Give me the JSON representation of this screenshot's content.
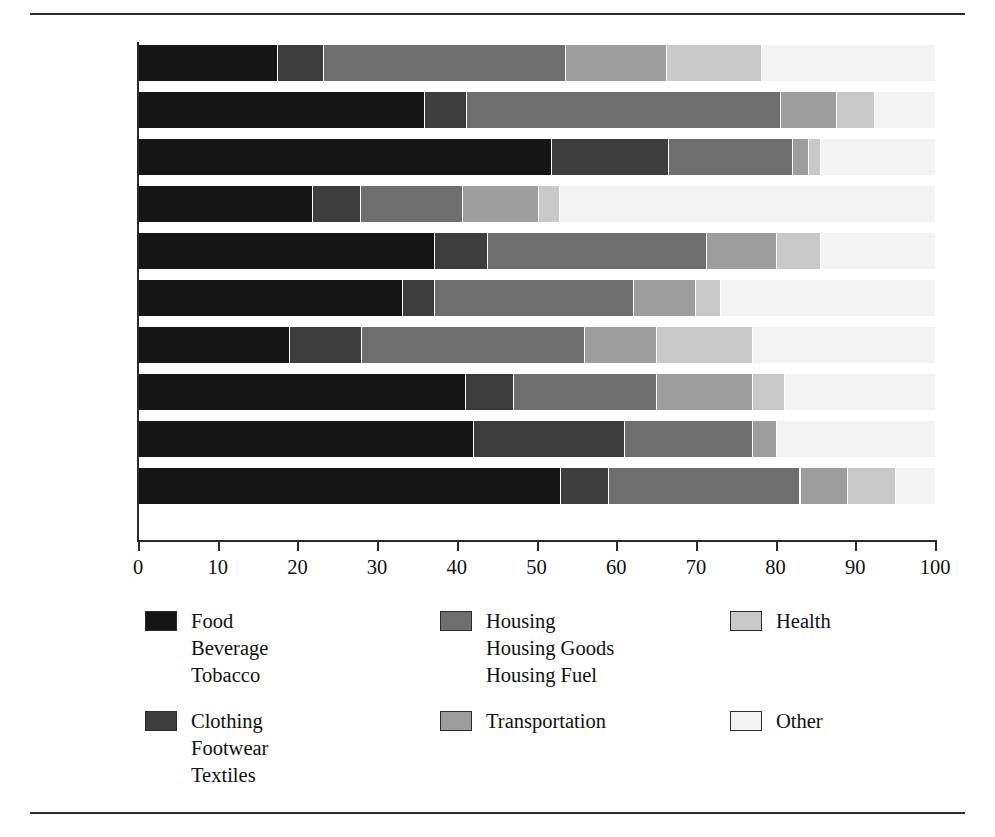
{
  "figure": {
    "title": "",
    "has_top_rule": true,
    "has_bottom_rule": true
  },
  "chart_data": {
    "type": "bar",
    "orientation": "horizontal",
    "stacked": true,
    "normalized_percent": true,
    "title": "",
    "xlabel": "",
    "ylabel": "",
    "xlim": [
      0,
      100
    ],
    "grid": false,
    "legend_position": "bottom",
    "xticks": [
      0,
      10,
      20,
      30,
      40,
      50,
      60,
      70,
      80,
      90,
      100
    ],
    "xticklabels": [
      "0",
      "10",
      "20",
      "30",
      "40",
      "50",
      "60",
      "70",
      "80",
      "90",
      "100"
    ],
    "categories": [
      "U.S.",
      "Argentina",
      "China",
      "Japan",
      "Taiwan",
      "S. Africa",
      "France",
      "Ireland",
      "U.S.S.R.",
      "Turkey"
    ],
    "series": [
      {
        "name": "Food\nBeverage\nTobacco",
        "short_name": "Food Beverage Tobacco",
        "color": "#151515",
        "values": [
          17.5,
          35.9,
          51.8,
          21.8,
          37.1,
          33.1,
          19.0,
          41.0,
          42.0,
          53.0
        ]
      },
      {
        "name": "Clothing\nFootwear\nTextiles",
        "short_name": "Clothing Footwear Textiles",
        "color": "#3d3d3d",
        "values": [
          5.7,
          5.3,
          14.7,
          6.1,
          6.7,
          4.0,
          9.0,
          6.0,
          19.0,
          6.0
        ]
      },
      {
        "name": "Housing\nHousing Goods\nHousing Fuel",
        "short_name": "Housing Housing Goods Housing Fuel",
        "color": "#6e6e6e",
        "values": [
          30.4,
          39.4,
          15.6,
          12.7,
          27.5,
          25.0,
          28.0,
          18.0,
          16.0,
          24.0
        ]
      },
      {
        "name": "Transportation",
        "short_name": "Transportation",
        "color": "#9d9d9d",
        "values": [
          12.6,
          7.0,
          2.0,
          9.6,
          8.8,
          7.8,
          9.0,
          12.0,
          3.0,
          6.0
        ]
      },
      {
        "name": "Health",
        "short_name": "Health",
        "color": "#c8c8c8",
        "values": [
          12.0,
          4.7,
          1.5,
          2.6,
          5.5,
          3.1,
          12.0,
          4.0,
          0.0,
          6.0
        ]
      },
      {
        "name": "Other",
        "short_name": "Other",
        "color": "#f3f3f3",
        "values": [
          21.8,
          7.7,
          14.4,
          47.2,
          14.4,
          27.0,
          23.0,
          19.0,
          20.0,
          5.0
        ]
      }
    ],
    "stack_boundaries": {
      "U.S.": [
        17.5,
        23.2,
        53.6,
        66.2,
        78.2,
        100
      ],
      "Argentina": [
        35.9,
        41.2,
        80.6,
        87.6,
        92.3,
        100
      ],
      "China": [
        51.8,
        66.5,
        82.1,
        84.1,
        85.6,
        100
      ],
      "Japan": [
        21.8,
        27.9,
        40.6,
        50.2,
        52.8,
        100
      ],
      "Taiwan": [
        37.1,
        43.8,
        71.3,
        80.1,
        85.6,
        100
      ],
      "S. Africa": [
        33.1,
        37.1,
        62.1,
        69.9,
        73.0,
        100
      ],
      "France": [
        19.0,
        28.0,
        56.0,
        65.0,
        77.0,
        100
      ],
      "Ireland": [
        41.0,
        47.0,
        65.0,
        77.0,
        81.0,
        100
      ],
      "U.S.S.R.": [
        42.0,
        61.0,
        77.0,
        80.0,
        80.0,
        100
      ],
      "Turkey": [
        53.0,
        59.0,
        83.0,
        89.0,
        95.0,
        100
      ]
    }
  },
  "legend": {
    "entries": [
      {
        "label": "Food\nBeverage\nTobacco",
        "color": "#151515",
        "column": 0,
        "row": 0
      },
      {
        "label": "Clothing\nFootwear\nTextiles",
        "color": "#3d3d3d",
        "column": 0,
        "row": 1
      },
      {
        "label": "Housing\nHousing Goods\nHousing Fuel",
        "color": "#6e6e6e",
        "column": 1,
        "row": 0
      },
      {
        "label": "Transportation",
        "color": "#9d9d9d",
        "column": 1,
        "row": 1
      },
      {
        "label": "Health",
        "color": "#c8c8c8",
        "column": 2,
        "row": 0
      },
      {
        "label": "Other",
        "color": "#f3f3f3",
        "column": 2,
        "row": 1
      }
    ]
  }
}
